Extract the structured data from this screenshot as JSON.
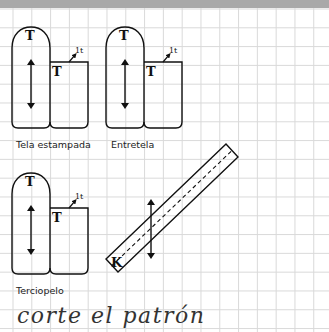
{
  "diagram": {
    "pieces": [
      {
        "id": "tela-estampada",
        "label": "Tela estampada",
        "tall_piece_letter": "T",
        "small_piece_letter": "T",
        "fold_mark": "1t"
      },
      {
        "id": "entretela",
        "label": "Entretela",
        "tall_piece_letter": "T",
        "small_piece_letter": "T",
        "fold_mark": "1t"
      },
      {
        "id": "terciopelo",
        "label": "Terciopelo",
        "tall_piece_letter": "T",
        "small_piece_letter": "T",
        "fold_mark": "1t"
      }
    ],
    "bias_strip": {
      "letter": "K"
    },
    "caption": "corte el patrón"
  },
  "colors": {
    "topbar": "#a9a9a9",
    "grid": "#d9d9d9",
    "ink": "#111111",
    "background": "#ffffff"
  }
}
